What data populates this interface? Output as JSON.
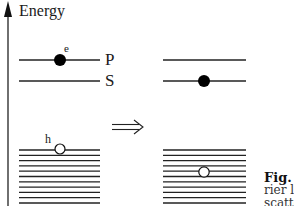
{
  "diagram": {
    "axis": {
      "label": "Energy"
    },
    "levels": {
      "p_label": "P",
      "s_label": "S"
    },
    "particles": {
      "electron_label": "e",
      "hole_label": "h"
    },
    "transition_arrow": "⟹",
    "before": {
      "electron_level": "P",
      "hole_position": "top of valence band"
    },
    "after": {
      "electron_level": "S",
      "hole_position": "inside valence band"
    },
    "valence_band": {
      "line_count": 11
    },
    "colors": {
      "line": "#222222",
      "electron_fill": "#000000",
      "hole_fill": "#ffffff"
    }
  },
  "caption": {
    "fig": "Fig.",
    "line2": "rier  l",
    "line3": "scatte"
  }
}
